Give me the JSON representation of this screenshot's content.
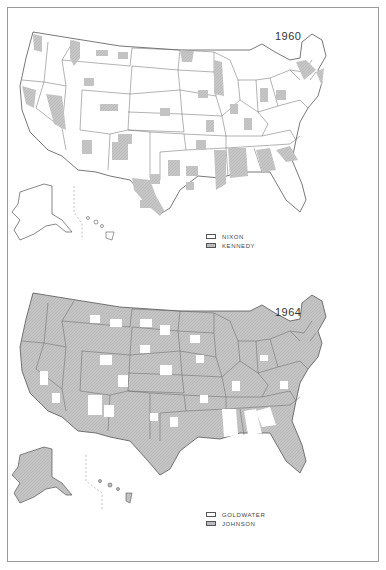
{
  "figure": {
    "colors": {
      "background": "#ffffff",
      "border": "#555555",
      "fill_a": "#ffffff",
      "fill_b": "#c4c4c4",
      "frame": "#9a9a9a"
    }
  },
  "maps": [
    {
      "year": "1960",
      "legend": [
        {
          "label": "NIXON",
          "swatch": "white"
        },
        {
          "label": "KENNEDY",
          "swatch": "gray"
        }
      ],
      "predominant": "white"
    },
    {
      "year": "1964",
      "legend": [
        {
          "label": "GOLDWATER",
          "swatch": "white"
        },
        {
          "label": "JOHNSON",
          "swatch": "gray"
        }
      ],
      "predominant": "gray"
    }
  ]
}
